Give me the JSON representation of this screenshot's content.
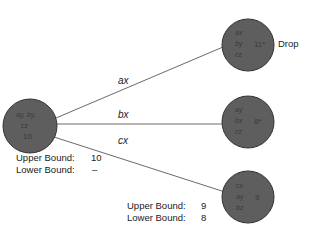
{
  "colors": {
    "node_fill": "#5e5e5e",
    "node_stroke": "#333333",
    "edge": "#444444"
  },
  "root": {
    "lines": [
      "ay, by,",
      "cz",
      "10"
    ],
    "upper_bound_label": "Upper Bound:",
    "upper_bound_value": "10",
    "lower_bound_label": "Lower Bound:",
    "lower_bound_value": "–"
  },
  "edges": [
    {
      "label": "ax"
    },
    {
      "label": "bx"
    },
    {
      "label": "cx"
    }
  ],
  "children": [
    {
      "lines": [
        "ax",
        "by",
        "cz"
      ],
      "value": "11*",
      "note": "Drop"
    },
    {
      "lines": [
        "ay",
        "bx",
        "cz"
      ],
      "value": "8*"
    },
    {
      "lines": [
        "cx",
        "ay",
        "bz"
      ],
      "value": "9",
      "upper_bound_label": "Upper Bound:",
      "upper_bound_value": "9",
      "lower_bound_label": "Lower Bound:",
      "lower_bound_value": "8"
    }
  ]
}
